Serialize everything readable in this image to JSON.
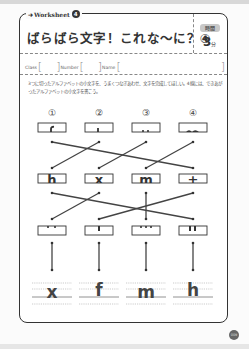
{
  "worksheet": {
    "label": "Worksheet",
    "number": "4",
    "title": "ばらばら文字！これな〜に？④",
    "time_label": "時間",
    "time_value": "3",
    "time_unit": "分",
    "icon": "arrow-right-icon"
  },
  "fields": {
    "class_label": "Class",
    "number_label": "Number",
    "name_label": "Name",
    "class_value": "",
    "number_value": "",
    "name_value": ""
  },
  "instructions": "3つに切ったアルファベットの小文字を、うまくつなぎあわせ、文字を完成してほしい。4線には、できあがったアルファベットの小文字を書こう。",
  "puzzle": {
    "column_labels": [
      "①",
      "②",
      "③",
      "④"
    ],
    "row1_pieces": [
      "f-top",
      "t-top",
      "m-top-dots",
      "h-top"
    ],
    "row2_pieces": [
      "h",
      "x",
      "m",
      "t"
    ],
    "row3_pieces": [
      "two-dots",
      "one-bar",
      "three-dots",
      "two-bars"
    ],
    "connections_row1_to_row2": [
      [
        1,
        4
      ],
      [
        2,
        1
      ],
      [
        3,
        2
      ],
      [
        4,
        3
      ]
    ],
    "connections_row2_to_row3": [
      [
        1,
        4
      ],
      [
        2,
        1
      ],
      [
        3,
        3
      ],
      [
        4,
        2
      ]
    ],
    "connections_row3_to_answer": [
      [
        1,
        1
      ],
      [
        2,
        2
      ],
      [
        3,
        3
      ],
      [
        4,
        4
      ]
    ],
    "answers": [
      "x",
      "f",
      "m",
      "h"
    ]
  },
  "page_number": "009"
}
